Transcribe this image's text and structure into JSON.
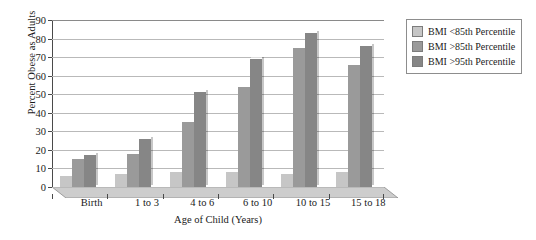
{
  "chart_data": {
    "type": "bar",
    "title": "",
    "xlabel": "Age of Child (Years)",
    "ylabel": "Percent Obese as Adults",
    "categories": [
      "Birth",
      "1 to 3",
      "4 to 6",
      "6 to 10",
      "10 to 15",
      "15 to 18"
    ],
    "series": [
      {
        "name": "BMI <85th Percentile",
        "color": "#c6c6c6",
        "values": [
          6,
          7,
          8,
          8,
          7,
          8
        ]
      },
      {
        "name": "BMI >85th Percentile",
        "color": "#9a9a9a",
        "values": [
          15,
          18,
          35,
          54,
          75,
          66
        ]
      },
      {
        "name": "BMI >95th Percentile",
        "color": "#868686",
        "values": [
          17,
          26,
          51,
          69,
          83,
          76
        ]
      }
    ],
    "ylim": [
      0,
      90
    ],
    "yticks": [
      0,
      10,
      20,
      30,
      40,
      50,
      60,
      70,
      80,
      90
    ],
    "ytick_labels": [
      "0",
      "10",
      "20",
      "30",
      "40",
      "50",
      "60",
      "70",
      "80",
      "90"
    ],
    "grid": true,
    "legend_position": "right-top"
  },
  "legend": {
    "items": [
      {
        "label": "BMI <85th Percentile",
        "color": "#c6c6c6"
      },
      {
        "label": "BMI >85th Percentile",
        "color": "#9a9a9a"
      },
      {
        "label": "BMI >95th Percentile",
        "color": "#868686"
      }
    ]
  },
  "axes": {
    "y_title": "Percent Obese as Adults",
    "x_title": "Age of Child (Years)"
  },
  "colors": {
    "gridline": "#b9b9b9",
    "axis": "#4a4a4a",
    "floor": "#cdcdcd",
    "plot_background": "#ffffff"
  }
}
